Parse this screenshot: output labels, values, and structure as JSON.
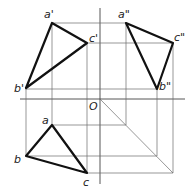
{
  "diagram": {
    "origin_label": "O",
    "front_view": {
      "points": [
        {
          "name": "a'",
          "x": 52,
          "y": 23
        },
        {
          "name": "b'",
          "x": 26,
          "y": 88
        },
        {
          "name": "c'",
          "x": 87,
          "y": 43
        }
      ]
    },
    "side_view": {
      "points": [
        {
          "name": "a\"",
          "x": 126,
          "y": 23
        },
        {
          "name": "b\"",
          "x": 157,
          "y": 89
        },
        {
          "name": "c\"",
          "x": 173,
          "y": 43
        }
      ]
    },
    "top_view": {
      "points": [
        {
          "name": "a",
          "x": 52,
          "y": 125
        },
        {
          "name": "b",
          "x": 26,
          "y": 156
        },
        {
          "name": "c",
          "x": 87,
          "y": 173
        }
      ]
    },
    "labels": {
      "a_front": "a'",
      "b_front": "b'",
      "c_front": "c'",
      "a_side": "a\"",
      "b_side": "b\"",
      "c_side": "c\"",
      "a_top": "a",
      "b_top": "b",
      "c_top": "c",
      "origin": "O"
    }
  }
}
